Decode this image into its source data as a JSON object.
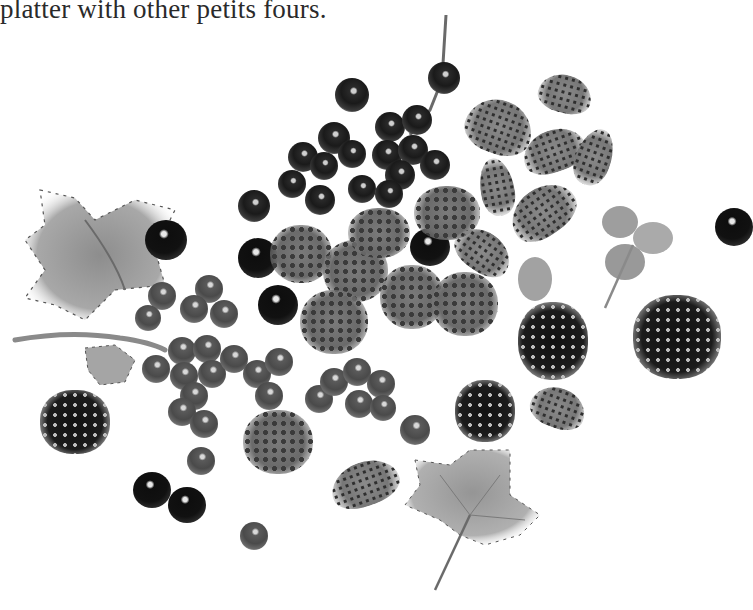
{
  "page": {
    "caption_fragment": "platter with other petits fours."
  },
  "illustration": {
    "description": "Grayscale watercolor illustration of assorted summer berries",
    "elements": [
      {
        "type": "currant-leaf",
        "label": "large currant leaf (upper left)"
      },
      {
        "type": "currant-leaf",
        "label": "currant leaf (bottom center)"
      },
      {
        "type": "strawberry-leaf",
        "label": "wild strawberry leaf (right)"
      },
      {
        "type": "currant-cluster",
        "label": "blackcurrants on stem (top center)"
      },
      {
        "type": "currant-cluster",
        "label": "redcurrants on stem (lower left)"
      },
      {
        "type": "raspberry",
        "label": "raspberries (center)"
      },
      {
        "type": "blackberry",
        "label": "blackberries"
      },
      {
        "type": "wild-strawberry",
        "label": "wild strawberries (upper right)"
      }
    ]
  }
}
